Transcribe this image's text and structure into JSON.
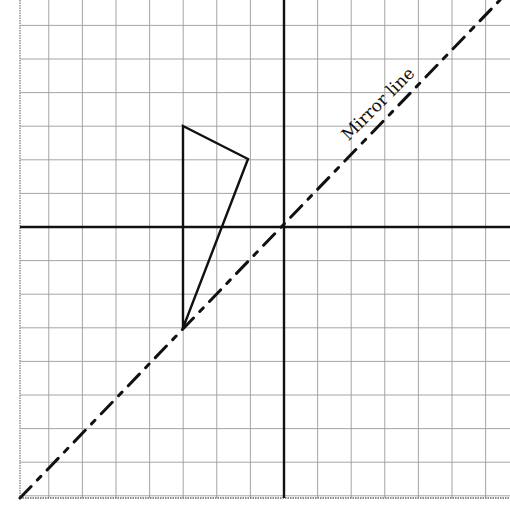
{
  "figure": {
    "type": "reflection-diagram",
    "grid": {
      "x0": 20,
      "y0": -10,
      "cell": 33.6,
      "cols": 15,
      "rows": 15,
      "left": 20,
      "right": 510,
      "top": 0,
      "bottom": 498,
      "color": "#9a9a9a"
    },
    "axes": {
      "origin": {
        "x": 284,
        "y": 227
      },
      "color": "#111111"
    },
    "triangle": {
      "vertices": [
        [
          183,
          126
        ],
        [
          248,
          159
        ],
        [
          183,
          328
        ]
      ],
      "grid_coords": [
        [
          -3,
          3
        ],
        [
          -1,
          2
        ],
        [
          -3,
          -3
        ]
      ],
      "color": "#111111"
    },
    "mirror_line": {
      "label": "Mirror line",
      "equation": "y = x",
      "from": [
        20,
        498
      ],
      "to": [
        500,
        0
      ],
      "label_pos": {
        "x": 382,
        "y": 108,
        "angle": -45
      },
      "color": "#111111"
    }
  }
}
